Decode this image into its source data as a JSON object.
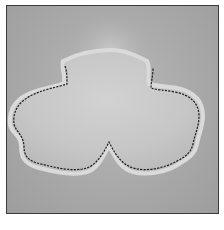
{
  "image": {
    "description": "Grayscale photograph of a stuffed felt shape with three rounded lobes, outlined by dark running stitches, on a grey felt background",
    "subject": "stuffed felt trefoil shape with stitched outline",
    "palette": {
      "background": "#a9a9a9",
      "felt_shape": "#c9c9c9",
      "stitch": "#1e1e1e",
      "frame_border": "#3a3a3a"
    }
  },
  "caption": {
    "text": "",
    "note_visible": "partially cropped caption text below photo"
  }
}
